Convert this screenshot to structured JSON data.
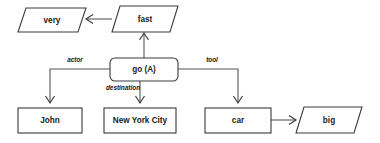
{
  "diagram": {
    "type": "semantic-network",
    "background_color": "#ffffff",
    "line_color": "#555555",
    "shape_stroke_color": "#3a3a3a",
    "text_color": "#1a1a1a",
    "nodes": [
      {
        "id": "very",
        "label": "very",
        "shape": "parallelogram",
        "x": 18,
        "y": 8,
        "w": 68,
        "h": 24
      },
      {
        "id": "fast",
        "label": "fast",
        "shape": "parallelogram",
        "x": 112,
        "y": 6,
        "w": 66,
        "h": 26
      },
      {
        "id": "go",
        "label": "go (A)",
        "shape": "rounded-rect",
        "x": 110,
        "y": 58,
        "w": 68,
        "h": 23
      },
      {
        "id": "john",
        "label": "John",
        "shape": "rectangle",
        "x": 18,
        "y": 108,
        "w": 64,
        "h": 25
      },
      {
        "id": "new-york-city",
        "label": "New York City",
        "shape": "rectangle",
        "x": 104,
        "y": 108,
        "w": 72,
        "h": 25
      },
      {
        "id": "car",
        "label": "car",
        "shape": "rectangle",
        "x": 205,
        "y": 108,
        "w": 66,
        "h": 25
      },
      {
        "id": "big",
        "label": "big",
        "shape": "parallelogram",
        "x": 296,
        "y": 107,
        "w": 66,
        "h": 26
      }
    ],
    "edges": [
      {
        "id": "fast-to-very",
        "from": "fast",
        "to": "very",
        "label": "",
        "direction": "left"
      },
      {
        "id": "go-to-fast",
        "from": "go",
        "to": "fast",
        "label": "",
        "direction": "up"
      },
      {
        "id": "go-to-john",
        "from": "go",
        "to": "john",
        "label": "actor",
        "direction": "down"
      },
      {
        "id": "go-to-new-york-city",
        "from": "go",
        "to": "new-york-city",
        "label": "destination",
        "direction": "down"
      },
      {
        "id": "go-to-car",
        "from": "go",
        "to": "car",
        "label": "tool",
        "direction": "down"
      },
      {
        "id": "car-to-big",
        "from": "car",
        "to": "big",
        "label": "",
        "direction": "right"
      }
    ],
    "edge_labels": {
      "actor": "actor",
      "destination": "destination",
      "tool": "tool"
    }
  }
}
